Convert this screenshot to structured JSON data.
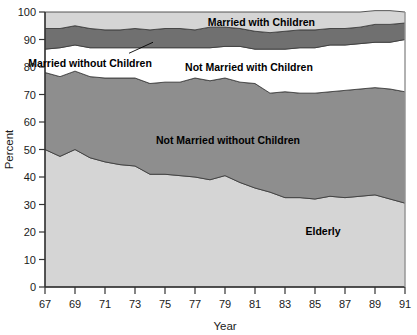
{
  "chart_data": {
    "type": "area",
    "stacked": true,
    "title": "",
    "xlabel": "Year",
    "ylabel": "Percent",
    "xlim": [
      67,
      91
    ],
    "ylim": [
      0,
      100
    ],
    "grid": false,
    "legend_position": "inline-labels",
    "x": [
      67,
      68,
      69,
      70,
      71,
      72,
      73,
      74,
      75,
      76,
      77,
      78,
      79,
      80,
      81,
      82,
      83,
      84,
      85,
      86,
      87,
      88,
      89,
      90,
      91
    ],
    "xtick_labels": [
      "67",
      "69",
      "71",
      "73",
      "75",
      "77",
      "79",
      "81",
      "83",
      "85",
      "87",
      "89",
      "91"
    ],
    "xtick_values": [
      67,
      69,
      71,
      73,
      75,
      77,
      79,
      81,
      83,
      85,
      87,
      89,
      91
    ],
    "ytick_labels": [
      "0",
      "10",
      "20",
      "30",
      "40",
      "50",
      "60",
      "70",
      "80",
      "90",
      "100"
    ],
    "ytick_values": [
      0,
      10,
      20,
      30,
      40,
      50,
      60,
      70,
      80,
      90,
      100
    ],
    "series": [
      {
        "name": "Elderly",
        "color": "#d5d5d5",
        "label_x": 86.7,
        "label_y": 20.5,
        "values": [
          50.0,
          47.5,
          50.0,
          47.0,
          45.5,
          44.5,
          44.0,
          41.0,
          41.0,
          40.5,
          40.0,
          39.0,
          40.5,
          38.0,
          36.0,
          34.5,
          32.5,
          32.5,
          32.0,
          33.0,
          32.5,
          33.0,
          33.5,
          32.0,
          30.5
        ]
      },
      {
        "name": "Not Married without Children",
        "color": "#8e8e8e",
        "label_x": 79.2,
        "label_y": 53.5,
        "values": [
          28.0,
          29.0,
          28.5,
          29.5,
          30.5,
          31.5,
          32.0,
          33.0,
          33.5,
          34.0,
          36.0,
          36.0,
          35.5,
          36.5,
          38.0,
          36.0,
          38.5,
          38.0,
          38.5,
          38.0,
          39.0,
          39.0,
          39.0,
          40.0,
          40.5
        ]
      },
      {
        "name": "Not Married with Children",
        "color": "#ffffff",
        "label_x": 80.6,
        "label_y": 80.0,
        "values": [
          8.5,
          10.5,
          9.5,
          10.5,
          11.0,
          11.0,
          11.0,
          13.0,
          12.5,
          12.5,
          11.0,
          12.0,
          11.5,
          13.0,
          12.5,
          16.0,
          15.5,
          16.5,
          16.5,
          17.0,
          16.5,
          16.5,
          16.5,
          17.0,
          19.0
        ]
      },
      {
        "name": "Married without Children",
        "color": "#707070",
        "label_x": 70.0,
        "label_y": 81.5,
        "leader_line": {
          "x1": 72.6,
          "y1": 85.0,
          "x2": 74.2,
          "y2": 89.0
        },
        "values": [
          7.5,
          7.0,
          7.0,
          7.0,
          6.5,
          6.5,
          7.0,
          6.5,
          7.0,
          7.0,
          6.5,
          7.5,
          7.0,
          6.5,
          6.5,
          6.0,
          6.5,
          6.5,
          6.5,
          6.0,
          6.0,
          6.0,
          6.5,
          6.5,
          6.0
        ]
      },
      {
        "name": "Married with Children",
        "color": "#d5d5d5",
        "label_x": 85.0,
        "label_y": 96.5,
        "values": [
          6.0,
          6.0,
          5.0,
          6.0,
          6.5,
          6.5,
          6.0,
          6.5,
          6.0,
          6.0,
          6.5,
          5.5,
          5.5,
          6.0,
          7.0,
          7.5,
          7.0,
          6.5,
          6.5,
          6.0,
          6.0,
          5.5,
          5.0,
          5.0,
          4.0
        ]
      }
    ],
    "cumulative_tops": {
      "elderly": [
        50.0,
        47.5,
        50.0,
        47.0,
        45.5,
        44.5,
        44.0,
        41.0,
        41.0,
        40.5,
        40.0,
        39.0,
        40.5,
        38.0,
        36.0,
        34.5,
        32.5,
        32.5,
        32.0,
        33.0,
        32.5,
        33.0,
        33.5,
        32.0,
        30.5
      ],
      "not_married_without": [
        78.0,
        76.5,
        78.5,
        76.5,
        76.0,
        76.0,
        76.0,
        74.0,
        74.5,
        74.5,
        76.0,
        75.0,
        76.0,
        74.5,
        74.0,
        70.5,
        71.0,
        70.5,
        70.5,
        71.0,
        71.5,
        72.0,
        72.5,
        72.0,
        71.0
      ],
      "not_married_with": [
        86.5,
        87.0,
        88.0,
        87.0,
        87.0,
        87.0,
        87.0,
        87.0,
        87.0,
        87.0,
        87.0,
        87.0,
        87.5,
        87.5,
        86.5,
        86.5,
        86.5,
        87.0,
        87.0,
        88.0,
        88.0,
        88.5,
        89.0,
        89.0,
        90.0
      ],
      "married_without": [
        94.0,
        94.0,
        95.0,
        94.0,
        93.5,
        93.5,
        94.0,
        93.5,
        94.0,
        94.0,
        93.5,
        94.5,
        94.5,
        94.0,
        93.0,
        92.5,
        93.0,
        93.5,
        93.5,
        94.0,
        94.0,
        94.5,
        95.0,
        95.0,
        96.0
      ],
      "married_with": [
        100,
        100,
        100,
        100,
        100,
        100,
        100,
        100,
        100,
        100,
        100,
        100,
        100,
        100,
        100,
        100,
        100,
        100,
        100,
        100,
        100,
        100,
        100,
        100,
        100
      ]
    }
  },
  "axes": {
    "ylabel": "Percent",
    "xlabel": "Year"
  },
  "colors": {
    "light_gray": "#d5d5d5",
    "medium_gray": "#8e8e8e",
    "dark_gray": "#707070",
    "white": "#ffffff",
    "axis": "#333333",
    "text": "#1a1a1a"
  }
}
